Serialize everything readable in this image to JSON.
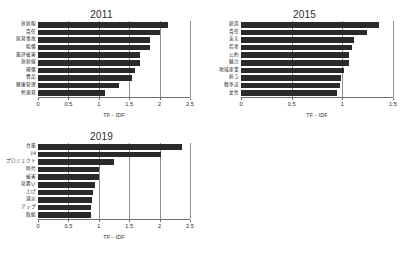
{
  "figure": {
    "top_cut_text": "",
    "background_color": "#ffffff",
    "bar_color": "#2a2a2a",
    "grid_color": "#8f8f8f"
  },
  "chart_data": [
    {
      "type": "bar",
      "orientation": "horizontal",
      "title": "2011",
      "xlabel": "TF - IDF",
      "ylabel": "",
      "xlim": [
        0,
        2.5
      ],
      "xticks": [
        "0",
        "0.5",
        "1",
        "1.5",
        "2",
        "2.5"
      ],
      "xtick_values": [
        0,
        0.5,
        1,
        1.5,
        2,
        2.5
      ],
      "grid": true,
      "legend": "none",
      "categories": [
        "放射能",
        "責任",
        "原発事故",
        "賠償",
        "風評被害",
        "放射線",
        "補償",
        "食品",
        "健康管理",
        "熱源発"
      ],
      "values": [
        2.13,
        2.0,
        1.85,
        1.84,
        1.68,
        1.67,
        1.6,
        1.55,
        1.33,
        1.1
      ]
    },
    {
      "type": "bar",
      "orientation": "horizontal",
      "title": "2015",
      "xlabel": "TF - IDF",
      "ylabel": "",
      "xlim": [
        0,
        1.5
      ],
      "xticks": [
        "0",
        "0.5",
        "1",
        "1.5"
      ],
      "xtick_values": [
        0,
        0.5,
        1,
        1.5
      ],
      "grid": true,
      "legend": "none",
      "categories": [
        "創造",
        "責任",
        "支え",
        "若者",
        "公約",
        "魅力",
        "地域産業",
        "担う",
        "戦争法",
        "女性"
      ],
      "values": [
        1.36,
        1.24,
        1.12,
        1.1,
        1.07,
        1.07,
        1.02,
        0.99,
        0.98,
        0.95
      ]
    },
    {
      "type": "bar",
      "orientation": "horizontal",
      "title": "2019",
      "xlabel": "TF - IDF",
      "ylabel": "",
      "xlim": [
        0,
        2.5
      ],
      "xticks": [
        "0",
        "0.5",
        "1",
        "1.5",
        "2",
        "2.5"
      ],
      "xtick_values": [
        0,
        0.5,
        1,
        1.5,
        2,
        2.5
      ],
      "grid": true,
      "legend": "none",
      "categories": [
        "台風",
        "19",
        "プロジェクト",
        "時代",
        "被害",
        "見舞い",
        "上げ",
        "減災",
        "アップ",
        "取組"
      ],
      "values": [
        2.37,
        2.03,
        1.25,
        1.0,
        1.0,
        0.93,
        0.9,
        0.88,
        0.87,
        0.87
      ]
    }
  ]
}
